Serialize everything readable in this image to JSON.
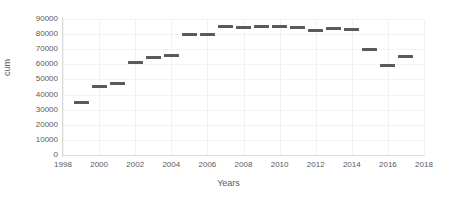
{
  "chart_data": {
    "type": "scatter",
    "title": "",
    "xlabel": "Years",
    "ylabel": "cum",
    "x": [
      1999,
      2000,
      2001,
      2002,
      2003,
      2004,
      2005,
      2006,
      2007,
      2008,
      2009,
      2010,
      2011,
      2012,
      2013,
      2014,
      2015,
      2016,
      2017
    ],
    "values": [
      35000,
      45500,
      47000,
      61000,
      64500,
      66000,
      79500,
      79500,
      85000,
      84500,
      85000,
      85000,
      84500,
      82500,
      83500,
      83000,
      70000,
      59000,
      65000
    ],
    "series": [
      {
        "name": "cum",
        "marker": "dash",
        "color": "#5a5a5a",
        "values": [
          35000,
          45500,
          47000,
          61000,
          64500,
          66000,
          79500,
          79500,
          85000,
          84500,
          85000,
          85000,
          84500,
          82500,
          83500,
          83000,
          70000,
          59000,
          65000
        ]
      }
    ],
    "xlim": [
      1998,
      2018
    ],
    "ylim": [
      0,
      90000
    ],
    "xticks": [
      1998,
      2000,
      2002,
      2004,
      2006,
      2008,
      2010,
      2012,
      2014,
      2016,
      2018
    ],
    "xtick_labels": [
      "1998",
      "2000",
      "2002",
      "2004",
      "2006",
      "2008",
      "2010",
      "2012",
      "2014",
      "2016",
      "2018"
    ],
    "yticks": [
      0,
      10000,
      20000,
      30000,
      40000,
      50000,
      60000,
      70000,
      80000,
      90000
    ],
    "ytick_labels": [
      "0",
      "10000",
      "20000",
      "30000",
      "40000",
      "50000",
      "60000",
      "70000",
      "80000",
      "90000"
    ],
    "grid": {
      "horizontal": true,
      "vertical": true,
      "color": "#f2f2f2"
    },
    "legend": {
      "visible": false,
      "position": "none"
    },
    "colors": {
      "marker": "#5a5a5a",
      "axis": "#d9d9d9",
      "text": "#595959",
      "background": "#ffffff"
    }
  }
}
